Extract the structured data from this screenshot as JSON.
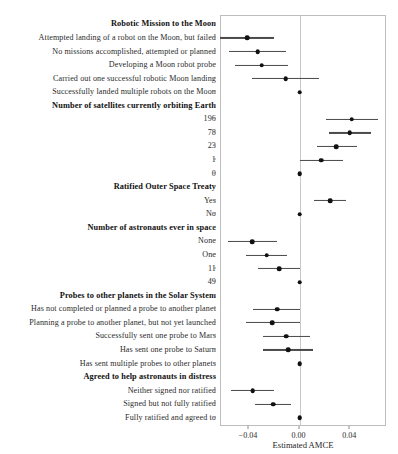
{
  "chart_data": {
    "type": "scatter",
    "subtype": "coefficient-forest-plot",
    "title": "",
    "xlabel": "Estimated AMCE",
    "ylabel": "",
    "xlim": [
      -0.062,
      0.069
    ],
    "xticks": [
      -0.04,
      0.0,
      0.04
    ],
    "xticklabels": [
      "−0.04",
      "0.00",
      "0.04"
    ],
    "grid": false,
    "legend": null,
    "reference_line": 0.0,
    "groups": [
      {
        "name": "Robotic Mission to the Moon",
        "levels": [
          {
            "label": "Attempted landing of a robot on the Moon, but failed",
            "estimate": -0.0415,
            "ci_low": -0.0625,
            "ci_high": -0.0205,
            "reference": false
          },
          {
            "label": "No missions accomplished, attempted or planned",
            "estimate": -0.033,
            "ci_low": -0.0555,
            "ci_high": -0.0105,
            "reference": false
          },
          {
            "label": "Developing a Moon robot probe",
            "estimate": -0.03,
            "ci_low": -0.051,
            "ci_high": -0.009,
            "reference": false
          },
          {
            "label": "Carried out one successful robotic Moon landing",
            "estimate": -0.011,
            "ci_low": -0.0375,
            "ci_high": 0.0155,
            "reference": false
          },
          {
            "label": "Successfully landed multiple robots on the Moon",
            "estimate": 0.0,
            "ci_low": 0.0,
            "ci_high": 0.0,
            "reference": true
          }
        ]
      },
      {
        "name": "Number of satellites currently orbiting Earth",
        "levels": [
          {
            "label": "196",
            "estimate": 0.041,
            "ci_low": 0.021,
            "ci_high": 0.062,
            "reference": false
          },
          {
            "label": "78",
            "estimate": 0.0395,
            "ci_low": 0.023,
            "ci_high": 0.056,
            "reference": false
          },
          {
            "label": "23",
            "estimate": 0.029,
            "ci_low": 0.0135,
            "ci_high": 0.045,
            "reference": false
          },
          {
            "label": "1",
            "estimate": 0.017,
            "ci_low": 0.0,
            "ci_high": 0.034,
            "reference": false
          },
          {
            "label": "0",
            "estimate": 0.0,
            "ci_low": 0.0,
            "ci_high": 0.0,
            "reference": true
          }
        ]
      },
      {
        "name": "Ratified Outer Space Treaty",
        "levels": [
          {
            "label": "Yes",
            "estimate": 0.024,
            "ci_low": 0.0115,
            "ci_high": 0.0365,
            "reference": false
          },
          {
            "label": "No",
            "estimate": 0.0,
            "ci_low": 0.0,
            "ci_high": 0.0,
            "reference": true
          }
        ]
      },
      {
        "name": "Number of astronauts ever in space",
        "levels": [
          {
            "label": "None",
            "estimate": -0.0375,
            "ci_low": -0.0565,
            "ci_high": -0.018,
            "reference": false
          },
          {
            "label": "One",
            "estimate": -0.026,
            "ci_low": -0.042,
            "ci_high": -0.01,
            "reference": false
          },
          {
            "label": "11",
            "estimate": -0.016,
            "ci_low": -0.0325,
            "ci_high": 0.0,
            "reference": false
          },
          {
            "label": "49",
            "estimate": 0.0,
            "ci_low": 0.0,
            "ci_high": 0.0,
            "reference": true
          }
        ]
      },
      {
        "name": "Probes to other planets in the Solar System",
        "levels": [
          {
            "label": "Has not completed or planned a probe to another planet",
            "estimate": -0.0175,
            "ci_low": -0.037,
            "ci_high": 0.0,
            "reference": false
          },
          {
            "label": "Planning a probe to another planet, but not yet launched",
            "estimate": -0.0215,
            "ci_low": -0.042,
            "ci_high": 0.0,
            "reference": false
          },
          {
            "label": "Successfully sent one probe to Mars",
            "estimate": -0.0105,
            "ci_low": -0.029,
            "ci_high": 0.0085,
            "reference": false
          },
          {
            "label": "Has sent one probe to Saturn",
            "estimate": -0.009,
            "ci_low": -0.0285,
            "ci_high": 0.011,
            "reference": false
          },
          {
            "label": "Has sent multiple probes to other planets",
            "estimate": 0.0,
            "ci_low": 0.0,
            "ci_high": 0.0,
            "reference": true
          }
        ]
      },
      {
        "name": "Agreed to help astronauts in distress",
        "levels": [
          {
            "label": "Neither signed nor ratified",
            "estimate": -0.037,
            "ci_low": -0.054,
            "ci_high": -0.02,
            "reference": false
          },
          {
            "label": "Signed but not fully ratified",
            "estimate": -0.021,
            "ci_low": -0.0355,
            "ci_high": -0.007,
            "reference": false
          },
          {
            "label": "Fully ratified and agreed to",
            "estimate": 0.0,
            "ci_low": 0.0,
            "ci_high": 0.0,
            "reference": true
          }
        ]
      }
    ]
  },
  "colors": {
    "point": "#111111",
    "ci": "#4a4a4a",
    "panel_border": "#bdbdbd",
    "zero_line": "#c9c9c9",
    "background": "#ffffff"
  }
}
